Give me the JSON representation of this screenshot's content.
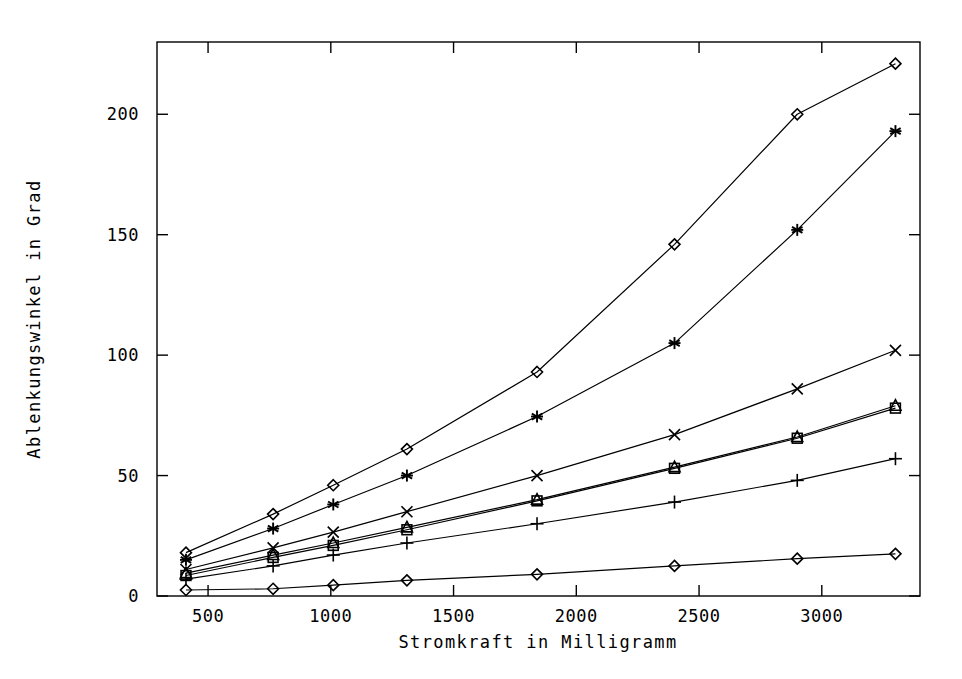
{
  "chart_data": {
    "type": "line",
    "title": "",
    "xlabel": "Stromkraft in Milligramm",
    "ylabel": "Ablenkungswinkel in Grad",
    "xlim": [
      292,
      3400
    ],
    "ylim": [
      0,
      230
    ],
    "xticks": [
      500,
      1000,
      1500,
      2000,
      2500,
      3000
    ],
    "xtick_labels": [
      "500",
      "1000",
      "1500",
      "2000",
      "2500",
      "3000"
    ],
    "yticks": [
      0,
      50,
      100,
      150,
      200
    ],
    "ytick_labels": [
      "0",
      "50",
      "100",
      "150",
      "200"
    ],
    "grid": false,
    "legend": "none",
    "x": [
      410,
      765,
      1010,
      1310,
      1840,
      2400,
      2900,
      3300
    ],
    "series": [
      {
        "name": "series-1",
        "marker": "diamond",
        "values": [
          18,
          34,
          46,
          61,
          93,
          146,
          200,
          221
        ]
      },
      {
        "name": "series-2",
        "marker": "star",
        "values": [
          15,
          28,
          38,
          50,
          74.5,
          105,
          152,
          193
        ]
      },
      {
        "name": "series-3",
        "marker": "x-cross",
        "values": [
          11,
          20,
          26.5,
          35,
          50,
          67,
          86,
          102
        ]
      },
      {
        "name": "series-4",
        "marker": "square",
        "values": [
          8.5,
          16,
          21,
          27.5,
          39.5,
          53,
          65.5,
          78
        ]
      },
      {
        "name": "series-5",
        "marker": "triangle",
        "values": [
          9.5,
          17,
          22,
          28.5,
          40,
          53.5,
          66,
          79
        ]
      },
      {
        "name": "series-6",
        "marker": "plus",
        "values": [
          7,
          12.5,
          17,
          22,
          30,
          39,
          48,
          57
        ]
      },
      {
        "name": "series-7",
        "marker": "diamond",
        "values": [
          2.5,
          3,
          4.5,
          6.5,
          9,
          12.5,
          15.5,
          17.5
        ]
      }
    ]
  }
}
